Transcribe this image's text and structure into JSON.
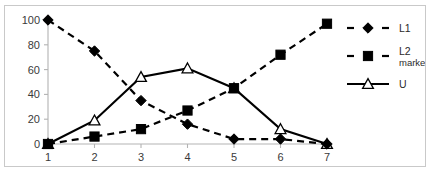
{
  "chart_data": {
    "type": "line",
    "title": "",
    "subtitle": "",
    "xlabel": "",
    "ylabel": "",
    "categories": [
      "1",
      "2",
      "3",
      "4",
      "5",
      "6",
      "7"
    ],
    "x": [
      1,
      2,
      3,
      4,
      5,
      6,
      7
    ],
    "xlim": [
      1,
      7
    ],
    "ylim": [
      0,
      100
    ],
    "yticks": [
      0,
      20,
      40,
      60,
      80,
      100
    ],
    "ytick_labels": [
      "0",
      "20",
      "40",
      "60",
      "80",
      "100"
    ],
    "xtick_labels": [
      "1",
      "2",
      "3",
      "4",
      "5",
      "6",
      "7"
    ],
    "grid": false,
    "legend_position": "right",
    "series": [
      {
        "name": "L1",
        "marker": "filled-diamond",
        "line_style": "dashed",
        "color": "#000000",
        "values": [
          100,
          75,
          35,
          16,
          4,
          4,
          0
        ]
      },
      {
        "name": "L2 marked",
        "name_line1": "L2",
        "name_line2": "marked",
        "marker": "filled-square",
        "line_style": "dashed",
        "color": "#000000",
        "values": [
          0,
          6,
          12,
          27,
          45,
          72,
          97
        ]
      },
      {
        "name": "U",
        "marker": "open-triangle",
        "line_style": "solid",
        "color": "#000000",
        "values": [
          0,
          19,
          54,
          61,
          45,
          12,
          0
        ]
      }
    ]
  },
  "legend": {
    "entries": [
      {
        "label": "L1",
        "sub": ""
      },
      {
        "label": "L2",
        "sub": "marked"
      },
      {
        "label": "U",
        "sub": ""
      }
    ]
  },
  "colors": {
    "frame_border": "#c9c9c9",
    "axis": "#b3b3b3",
    "series_ink": "#000000",
    "background": "#ffffff",
    "tick_text": "#3a3a3a"
  }
}
